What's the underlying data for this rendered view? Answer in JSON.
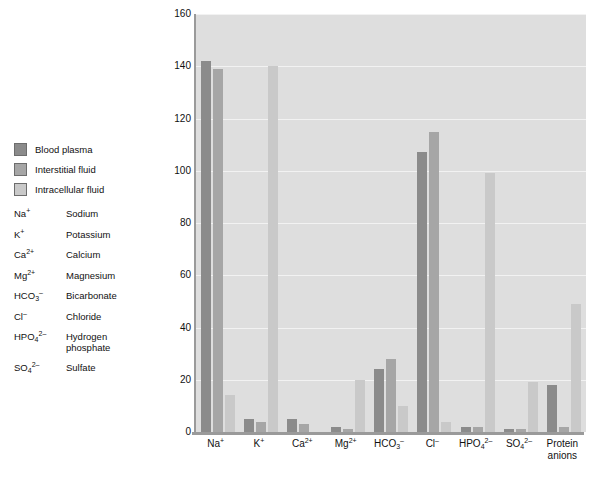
{
  "legend": {
    "items": [
      {
        "label": "Blood plasma",
        "color": "#8b8b8b",
        "key": "plasma"
      },
      {
        "label": "Interstitial fluid",
        "color": "#a6a6a6",
        "key": "interstitial"
      },
      {
        "label": "Intracellular fluid",
        "color": "#c9c9c9",
        "key": "intracellular"
      }
    ]
  },
  "abbreviations": [
    {
      "symbol": "Na+",
      "name": "Sodium"
    },
    {
      "symbol": "K+",
      "name": "Potassium"
    },
    {
      "symbol": "Ca2+",
      "name": "Calcium"
    },
    {
      "symbol": "Mg2+",
      "name": "Magnesium"
    },
    {
      "symbol": "HCO3-",
      "name": "Bicarbonate"
    },
    {
      "symbol": "Cl-",
      "name": "Chloride"
    },
    {
      "symbol": "HPO42-",
      "name": "Hydrogen phosphate"
    },
    {
      "symbol": "SO42-",
      "name": "Sulfate"
    }
  ],
  "chart_data": {
    "type": "bar",
    "title": "",
    "xlabel": "",
    "ylabel": "Total solute concentration (mEq/L)",
    "ylim": [
      0,
      160
    ],
    "yticks": [
      0,
      20,
      40,
      60,
      80,
      100,
      120,
      140,
      160
    ],
    "grid": true,
    "legend_position": "outside-left",
    "categories": [
      "Na+",
      "K+",
      "Ca2+",
      "Mg2+",
      "HCO3-",
      "Cl-",
      "HPO4 2-",
      "SO4 2-",
      "Protein anions"
    ],
    "series": [
      {
        "name": "Blood plasma",
        "color": "#8b8b8b",
        "values": [
          142,
          5,
          5,
          2,
          24,
          107,
          2,
          1,
          18
        ]
      },
      {
        "name": "Interstitial fluid",
        "color": "#a6a6a6",
        "values": [
          139,
          4,
          3,
          1,
          28,
          115,
          2,
          1,
          2
        ]
      },
      {
        "name": "Intracellular fluid",
        "color": "#c9c9c9",
        "values": [
          14,
          140,
          0,
          20,
          10,
          4,
          99,
          19,
          49
        ]
      }
    ]
  }
}
